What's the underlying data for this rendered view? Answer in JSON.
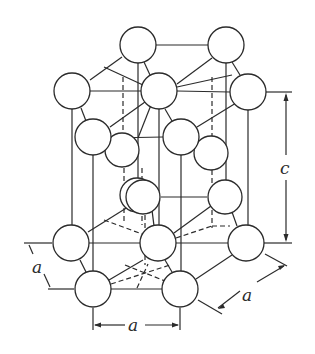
{
  "figure": {
    "labels": {
      "c": "c",
      "a_left": "a",
      "a_bottom": "a",
      "a_right": "a"
    }
  },
  "colors": {
    "stroke": "#2b2b2b",
    "atom_fill": "#ffffff",
    "background": "#ffffff"
  },
  "atoms": {
    "top_layer": [
      {
        "id": "top-back-left",
        "x": 138,
        "y": 45
      },
      {
        "id": "top-back-right",
        "x": 226,
        "y": 45
      },
      {
        "id": "top-left",
        "x": 72,
        "y": 91
      },
      {
        "id": "top-center",
        "x": 159,
        "y": 91
      },
      {
        "id": "top-right",
        "x": 248,
        "y": 92
      },
      {
        "id": "top-front-left",
        "x": 93,
        "y": 137
      },
      {
        "id": "top-front-right",
        "x": 181,
        "y": 137
      }
    ],
    "middle_layer": [
      {
        "id": "mid-back-left",
        "x": 122,
        "y": 150
      },
      {
        "id": "mid-back-right",
        "x": 211,
        "y": 153
      },
      {
        "id": "mid-front-left",
        "x": 143,
        "y": 197
      },
      {
        "id": "mid-front-right",
        "x": 225,
        "y": 197
      }
    ],
    "bottom_layer": [
      {
        "id": "bottom-left",
        "x": 71,
        "y": 243
      },
      {
        "id": "bottom-center",
        "x": 158,
        "y": 243
      },
      {
        "id": "bottom-right",
        "x": 246,
        "y": 243
      },
      {
        "id": "bottom-front-left",
        "x": 93,
        "y": 289
      },
      {
        "id": "bottom-front-right",
        "x": 180,
        "y": 289
      }
    ],
    "radius": 18
  }
}
